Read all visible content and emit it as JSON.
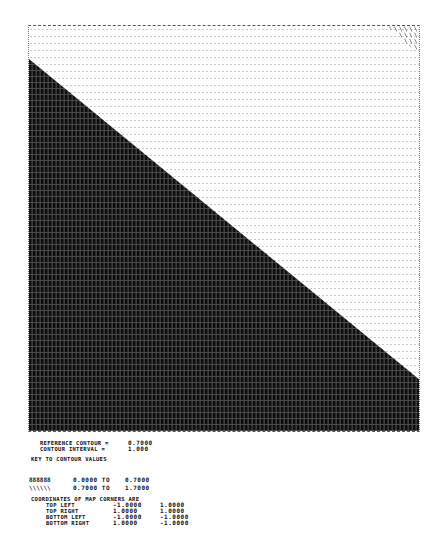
{
  "map": {
    "description": "Line-printer contour map with a diagonal shaded boundary",
    "fill_color": "#1a1a1a",
    "background_dot_color": "#c8c8c8",
    "frame": {
      "left": 28,
      "top": 25,
      "width": 392,
      "height": 407
    },
    "boundary": {
      "left_edge_y": 58,
      "right_edge_y": 380
    },
    "corner_hatch": "top-right"
  },
  "header": {
    "reference_contour_label": "REFERENCE CONTOUR =",
    "reference_contour_value": "0.7000",
    "contour_interval_label": "CONTOUR INTERVAL =",
    "contour_interval_value": "1.000",
    "key_title": "KEY TO CONTOUR VALUES"
  },
  "legend": [
    {
      "symbol": "888888",
      "from": "0.0000 TO",
      "to": "0.7000"
    },
    {
      "symbol": "\\\\\\\\\\\\",
      "from": "0.7000 TO",
      "to": "1.7000"
    }
  ],
  "corners": {
    "title": "COORDINATES OF MAP CORNERS ARE",
    "rows": [
      {
        "label": "TOP LEFT",
        "x": "-1.0000",
        "y": "1.0000"
      },
      {
        "label": "TOP RIGHT",
        "x": "1.0000",
        "y": "1.0000"
      },
      {
        "label": "BOTTOM LEFT",
        "x": "-1.0000",
        "y": "-1.0000"
      },
      {
        "label": "BOTTOM RIGHT",
        "x": "1.0000",
        "y": "-1.0000"
      }
    ]
  }
}
